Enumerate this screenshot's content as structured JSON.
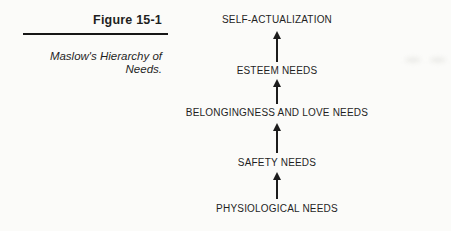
{
  "figure_header": {
    "label": "Figure 15-1"
  },
  "caption": {
    "full_text": "Maslow's Hierarchy of Needs.",
    "lines": [
      "Maslow's Hierarchy of",
      "Needs."
    ]
  },
  "diagram": {
    "type": "hierarchy",
    "direction": "bottom-to-top",
    "arrow_icon": "up-arrow",
    "levels_top_to_bottom": [
      "SELF-ACTUALIZATION",
      "ESTEEM NEEDS",
      "BELONGINGNESS AND LOVE NEEDS",
      "SAFETY NEEDS",
      "PHYSIOLOGICAL NEEDS"
    ]
  },
  "colors": {
    "background": "#fbfbf9",
    "text": "#1f1f1f",
    "rule": "#161616",
    "arrow": "#1c1c1c"
  }
}
